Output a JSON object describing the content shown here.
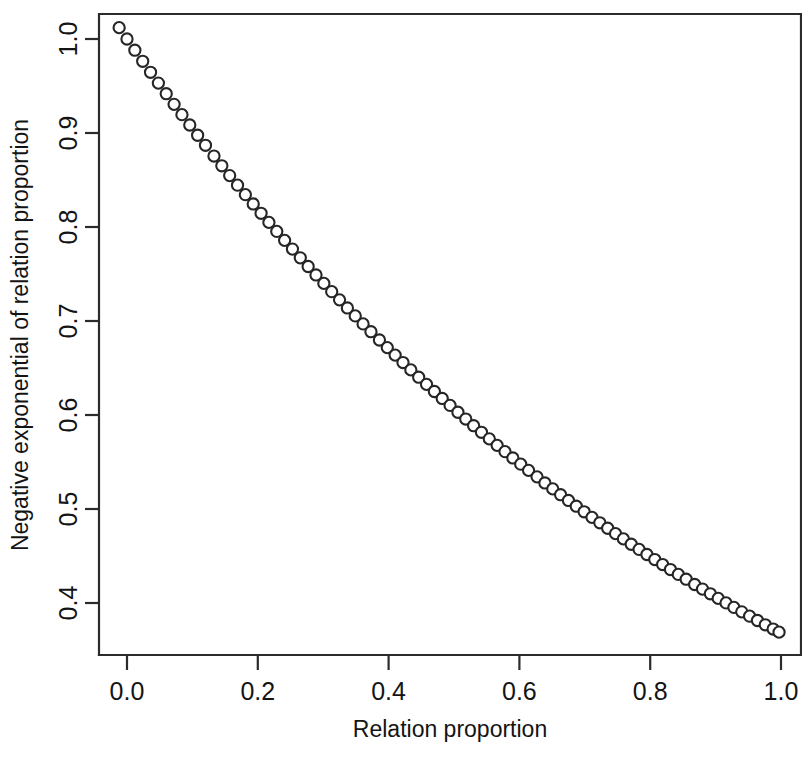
{
  "chart_data": {
    "type": "scatter",
    "title": "",
    "xlabel": "Relation proportion",
    "ylabel": "Negative exponential of relation proportion",
    "xlim": [
      -0.04,
      1.04
    ],
    "ylim": [
      0.355,
      1.02
    ],
    "xticks": [
      "0.0",
      "0.2",
      "0.4",
      "0.6",
      "0.8",
      "1.0"
    ],
    "xtick_values": [
      0.0,
      0.2,
      0.4,
      0.6,
      0.8,
      1.0
    ],
    "yticks": [
      "0.4",
      "0.5",
      "0.6",
      "0.7",
      "0.8",
      "0.9",
      "1.0"
    ],
    "ytick_values": [
      0.4,
      0.5,
      0.6,
      0.7,
      0.8,
      0.9,
      1.0
    ],
    "grid": false,
    "legend": null,
    "marker": "open-circle",
    "marker_radius_px": 5.6,
    "series": [
      {
        "name": "exp(-x)",
        "formula": "y = exp(-x)",
        "x": [
          -0.012,
          0.0,
          0.012,
          0.024,
          0.036,
          0.048,
          0.06,
          0.072,
          0.084,
          0.096,
          0.108,
          0.12,
          0.133,
          0.145,
          0.157,
          0.169,
          0.181,
          0.193,
          0.205,
          0.217,
          0.229,
          0.241,
          0.253,
          0.265,
          0.277,
          0.289,
          0.301,
          0.313,
          0.325,
          0.337,
          0.349,
          0.361,
          0.373,
          0.386,
          0.398,
          0.41,
          0.422,
          0.434,
          0.446,
          0.458,
          0.47,
          0.482,
          0.494,
          0.506,
          0.518,
          0.53,
          0.542,
          0.554,
          0.566,
          0.578,
          0.59,
          0.602,
          0.614,
          0.627,
          0.639,
          0.651,
          0.663,
          0.675,
          0.687,
          0.699,
          0.711,
          0.723,
          0.735,
          0.747,
          0.759,
          0.771,
          0.783,
          0.795,
          0.807,
          0.819,
          0.831,
          0.843,
          0.855,
          0.868,
          0.88,
          0.892,
          0.904,
          0.916,
          0.928,
          0.94,
          0.952,
          0.964,
          0.976,
          0.988,
          0.997
        ],
        "y": [
          1.0121,
          1.0,
          0.9881,
          0.9763,
          0.9646,
          0.9531,
          0.9418,
          0.9305,
          0.9195,
          0.9085,
          0.8976,
          0.8869,
          0.8755,
          0.8651,
          0.8547,
          0.8445,
          0.8344,
          0.8245,
          0.8146,
          0.8049,
          0.7953,
          0.7858,
          0.7765,
          0.7672,
          0.758,
          0.749,
          0.74,
          0.7312,
          0.7225,
          0.7139,
          0.7054,
          0.6969,
          0.6886,
          0.6798,
          0.6717,
          0.6637,
          0.6558,
          0.648,
          0.6402,
          0.6326,
          0.625,
          0.6176,
          0.6102,
          0.6029,
          0.5957,
          0.5886,
          0.5816,
          0.5746,
          0.5677,
          0.561,
          0.5543,
          0.5477,
          0.5411,
          0.5342,
          0.5277,
          0.5214,
          0.5152,
          0.5091,
          0.503,
          0.497,
          0.4911,
          0.4853,
          0.4795,
          0.4738,
          0.4682,
          0.4625,
          0.457,
          0.4516,
          0.4462,
          0.4409,
          0.4356,
          0.4304,
          0.4253,
          0.4197,
          0.4148,
          0.4098,
          0.4049,
          0.4001,
          0.3953,
          0.3906,
          0.386,
          0.3814,
          0.3768,
          0.3723,
          0.369
        ]
      }
    ]
  },
  "axes": {
    "x_title": "Relation proportion",
    "y_title": "Negative exponential of relation proportion"
  }
}
